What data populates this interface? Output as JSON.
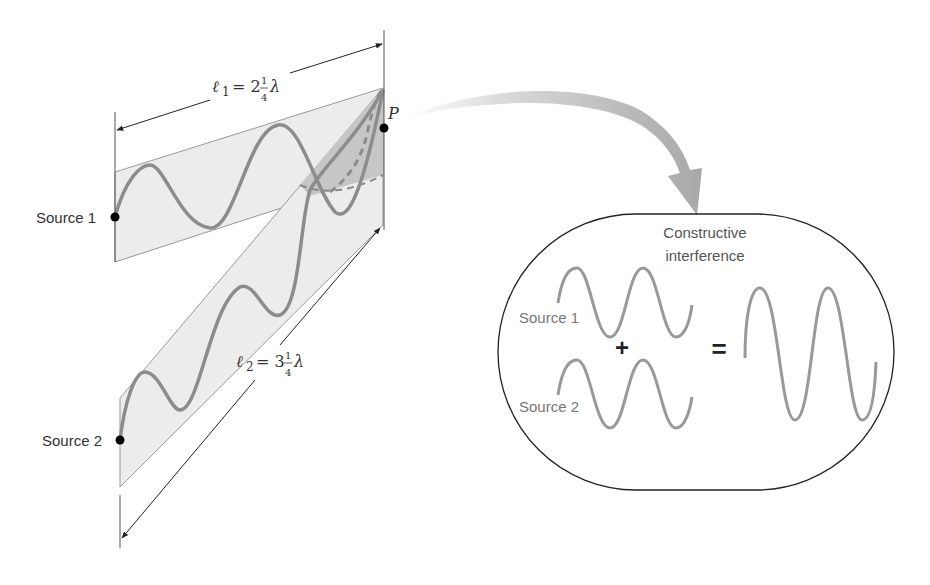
{
  "left_diagram": {
    "source1_label": "Source 1",
    "source2_label": "Source 2",
    "point_label": "P",
    "l1": {
      "symbol": "ℓ",
      "sub": "1",
      "eq": "= 2",
      "num": "1",
      "den": "4",
      "unit": "λ"
    },
    "l2": {
      "symbol": "ℓ",
      "sub": "2",
      "eq": "= 3",
      "num": "1",
      "den": "4",
      "unit": "λ"
    }
  },
  "right_panel": {
    "title_line1": "Constructive",
    "title_line2": "interference",
    "wave1_label": "Source 1",
    "wave2_label": "Source 2",
    "plus": "+",
    "equals": "="
  },
  "colors": {
    "band_fill": "#ececec",
    "overlap_fill": "#c6c6c6",
    "wave": "#8c8c8c",
    "arrow": "#b4b4b4",
    "ink": "#222222"
  }
}
